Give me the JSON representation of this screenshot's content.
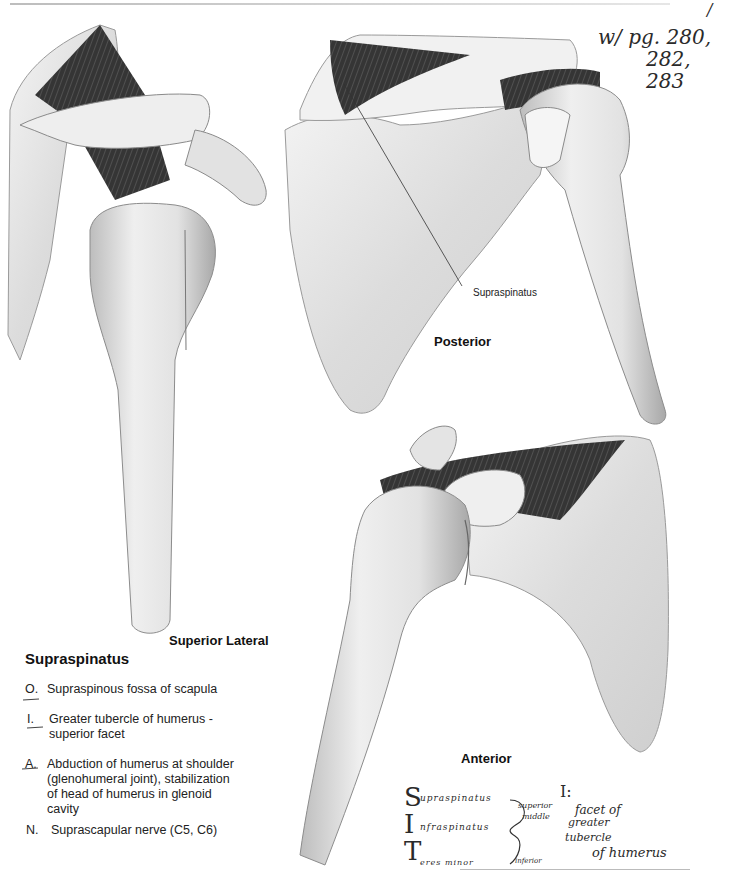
{
  "page": {
    "top_rule": true,
    "corner_mark": "/"
  },
  "handwritten_top_note": {
    "line1": "w/ pg. 280,",
    "line2": "282,",
    "line3": "283"
  },
  "figures": [
    {
      "id": "superior-lateral",
      "label": "Superior Lateral",
      "icon": "shoulder-superior-lateral-view-illustration"
    },
    {
      "id": "posterior",
      "label": "Posterior",
      "icon": "shoulder-posterior-view-illustration",
      "callout": "Supraspinatus"
    },
    {
      "id": "anterior",
      "label": "Anterior",
      "icon": "shoulder-anterior-view-illustration"
    }
  ],
  "muscle": {
    "title": "Supraspinatus",
    "entries": [
      {
        "key": "O.",
        "text": "Supraspinous fossa of scapula"
      },
      {
        "key": "I.",
        "text": "Greater tubercle of humerus - superior facet"
      },
      {
        "key": "A.",
        "text": "Abduction of humerus at shoulder (glenohumeral joint), stabilization of head of humerus in glenoid cavity"
      },
      {
        "key": "N.",
        "text": "Suprascapular nerve (C5, C6)"
      }
    ]
  },
  "handwritten_mnemonic": {
    "letters": [
      "S",
      "I",
      "T"
    ],
    "rows": [
      "upraspinatus",
      "nfraspinatus",
      "eres minor"
    ],
    "bracket_labels": [
      "superior",
      "middle",
      "inferior"
    ],
    "insertion_heading": "I:",
    "insertion_text": [
      "facet of",
      "greater",
      "tubercle",
      "of humerus"
    ]
  },
  "colors": {
    "bone_light": "#f2f2f2",
    "bone_mid": "#d8d8d8",
    "bone_shadow": "#a9a9a9",
    "muscle_dark": "#3a3a3a",
    "ink": "#222222"
  }
}
